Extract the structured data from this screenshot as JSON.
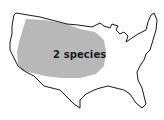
{
  "map": {
    "subject": "United States outline",
    "region_label": "2 species",
    "colors": {
      "background": "#ffffff",
      "outline": "#1a1a1a",
      "region_fill": "#b8b8b8",
      "label": "#1a1a1a"
    }
  }
}
